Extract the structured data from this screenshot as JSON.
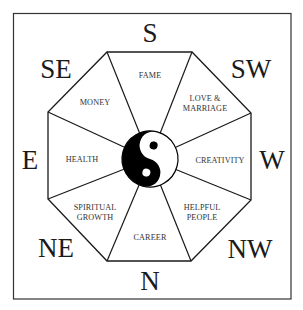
{
  "colors": {
    "line": "#1a1a1a",
    "background": "#ffffff",
    "yin": "#000000",
    "yang": "#ffffff"
  },
  "directions": {
    "s": "S",
    "sw": "SW",
    "w": "W",
    "nw": "NW",
    "n": "N",
    "ne": "NE",
    "e": "E",
    "se": "SE"
  },
  "areas": {
    "fame": [
      "FAME"
    ],
    "love": [
      "LOVE &",
      "MARRIAGE"
    ],
    "creativity": [
      "CREATIVITY"
    ],
    "helpful": [
      "HELPFUL",
      "PEOPLE"
    ],
    "career": [
      "CAREER"
    ],
    "spiritual": [
      "SPIRITUAL",
      "GROWTH"
    ],
    "health": [
      "HEALTH"
    ],
    "money": [
      "MONEY"
    ]
  },
  "center": {
    "symbol": "yin-yang"
  }
}
